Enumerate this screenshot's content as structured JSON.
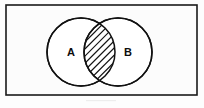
{
  "figure": {
    "kind": "venn-diagram",
    "background_color": "#fdfdfd"
  },
  "frame": {
    "name": "universal-set-frame",
    "x": 6,
    "y": 5,
    "width": 191,
    "height": 90,
    "stroke_color": "#1a1a1a",
    "fill_color": "#fcfcfc",
    "stroke_width": 1.6
  },
  "sets": [
    {
      "id": "A",
      "label": "A",
      "cx": 81,
      "cy": 52,
      "r": 34,
      "label_x": 71,
      "label_y": 52,
      "stroke_color": "#111111",
      "fill_color": "#ffffff"
    },
    {
      "id": "B",
      "label": "B",
      "cx": 118,
      "cy": 52,
      "r": 34,
      "label_x": 128,
      "label_y": 52,
      "stroke_color": "#111111",
      "fill_color": "#ffffff"
    }
  ],
  "intersection": {
    "name": "intersection-region",
    "label": "",
    "fill_style": "diagonal-hatch",
    "hatch_direction": "lower-left-to-upper-right",
    "hatch_line_count": 9,
    "hatch_spacing": 5,
    "hatch_color": "#111111",
    "hatch_width": 1.2,
    "left_x": 95,
    "right_x": 104,
    "top_y": 27,
    "bottom_y": 78
  },
  "chart_data": {
    "type": "venn",
    "categories": [
      "A",
      "B"
    ],
    "regions": [
      {
        "name": "A only",
        "shaded": false
      },
      {
        "name": "A ∩ B",
        "shaded": true
      },
      {
        "name": "B only",
        "shaded": false
      },
      {
        "name": "universe outside A ∪ B",
        "shaded": false
      }
    ],
    "legend": [],
    "xlabel": "",
    "ylabel": ""
  }
}
